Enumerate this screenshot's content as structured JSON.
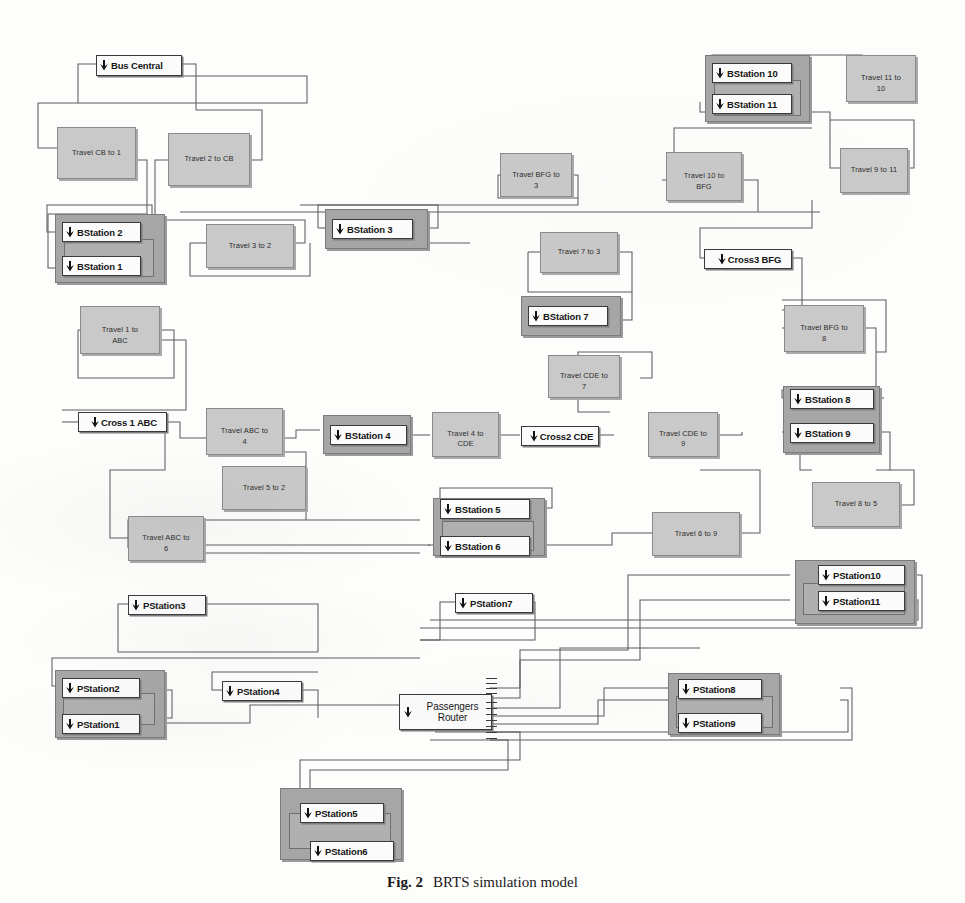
{
  "figure": {
    "caption_label": "Fig. 2",
    "caption_text": "BRTS simulation model"
  },
  "icons": {
    "block_input_arrow": "down-right-arrow-icon"
  },
  "colors": {
    "travel_block_fill": "#c9c9c9",
    "travel_block_border": "#8a8a8a",
    "subsystem_fill": "#a6a6a6",
    "subsystem_border": "#7b7b7b",
    "station_box_fill": "#fbfbfb",
    "station_box_border": "#3a3a3a",
    "wire": "#5d5d5d",
    "page_background": "#fdfdfc"
  },
  "diagram": {
    "type": "block-diagram",
    "title": "BRTS simulation model",
    "bus_central": {
      "label": "Bus Central"
    },
    "travel_blocks": [
      {
        "id": "t_cb_1",
        "label": "Travel CB to 1"
      },
      {
        "id": "t_2_cb",
        "label": "Travel 2 to CB"
      },
      {
        "id": "t_3_2",
        "label": "Travel 3 to 2"
      },
      {
        "id": "t_bfg_3",
        "label_line1": "Travel BFG to",
        "label_line2": "3"
      },
      {
        "id": "t_10_bfg",
        "label_line1": "Travel  10 to",
        "label_line2": "BFG"
      },
      {
        "id": "t_11_10",
        "label_line1": "Travel 11 to",
        "label_line2": "10"
      },
      {
        "id": "t_9_11",
        "label": "Travel 9 to 11"
      },
      {
        "id": "t_1_abc",
        "label_line1": "Travel   1 to",
        "label_line2": "ABC"
      },
      {
        "id": "t_7_3",
        "label": "Travel 7 to 3"
      },
      {
        "id": "t_bfg_8",
        "label_line1": "Travel BFG to",
        "label_line2": "8"
      },
      {
        "id": "t_cde_7",
        "label_line1": "Travel CDE to",
        "label_line2": "7"
      },
      {
        "id": "t_abc_4",
        "label_line1": "Travel ABC to",
        "label_line2": "4"
      },
      {
        "id": "t_4_cde",
        "label_line1": "Travel  4 to",
        "label_line2": "CDE"
      },
      {
        "id": "t_cde_9",
        "label_line1": "Travel CDE to",
        "label_line2": "9"
      },
      {
        "id": "t_5_2",
        "label": "Travel  5 to 2"
      },
      {
        "id": "t_8_5",
        "label": "Travel 8 to 5"
      },
      {
        "id": "t_abc_6",
        "label_line1": "Travel ABC to",
        "label_line2": "6"
      },
      {
        "id": "t_6_9",
        "label": "Travel 6 to 9"
      }
    ],
    "cross_blocks": [
      {
        "id": "cross1",
        "label": "Cross 1 ABC"
      },
      {
        "id": "cross2",
        "label": "Cross2 CDE"
      },
      {
        "id": "cross3",
        "label": "Cross3 BFG"
      }
    ],
    "bus_stations": [
      {
        "id": "bs1",
        "label": "BStation 1"
      },
      {
        "id": "bs2",
        "label": "BStation 2"
      },
      {
        "id": "bs3",
        "label": "BStation 3"
      },
      {
        "id": "bs4",
        "label": "BStation 4"
      },
      {
        "id": "bs5",
        "label": "BStation 5"
      },
      {
        "id": "bs6",
        "label": "BStation 6"
      },
      {
        "id": "bs7",
        "label": "BStation 7"
      },
      {
        "id": "bs8",
        "label": "BStation 8"
      },
      {
        "id": "bs9",
        "label": "BStation 9"
      },
      {
        "id": "bs10",
        "label": "BStation 10"
      },
      {
        "id": "bs11",
        "label": "BStation 11"
      }
    ],
    "passenger_stations": [
      {
        "id": "ps1",
        "label": "PStation1"
      },
      {
        "id": "ps2",
        "label": "PStation2"
      },
      {
        "id": "ps3",
        "label": "PStation3"
      },
      {
        "id": "ps4",
        "label": "PStation4"
      },
      {
        "id": "ps5",
        "label": "PStation5"
      },
      {
        "id": "ps6",
        "label": "PStation6"
      },
      {
        "id": "ps7",
        "label": "PStation7"
      },
      {
        "id": "ps8",
        "label": "PStation8"
      },
      {
        "id": "ps9",
        "label": "PStation9"
      },
      {
        "id": "ps10",
        "label": "PStation10"
      },
      {
        "id": "ps11",
        "label": "PStation11"
      }
    ],
    "passengers_router": {
      "label_line1": "Passengers",
      "label_line2": "Router"
    }
  }
}
